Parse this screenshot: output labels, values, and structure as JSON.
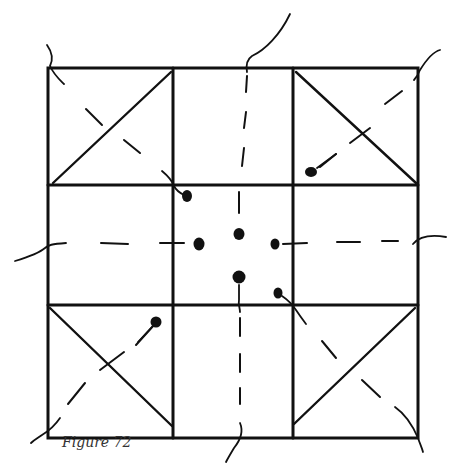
{
  "figure": {
    "caption": "Figure 72",
    "ink_color": "#111111",
    "background_color": "#ffffff"
  }
}
